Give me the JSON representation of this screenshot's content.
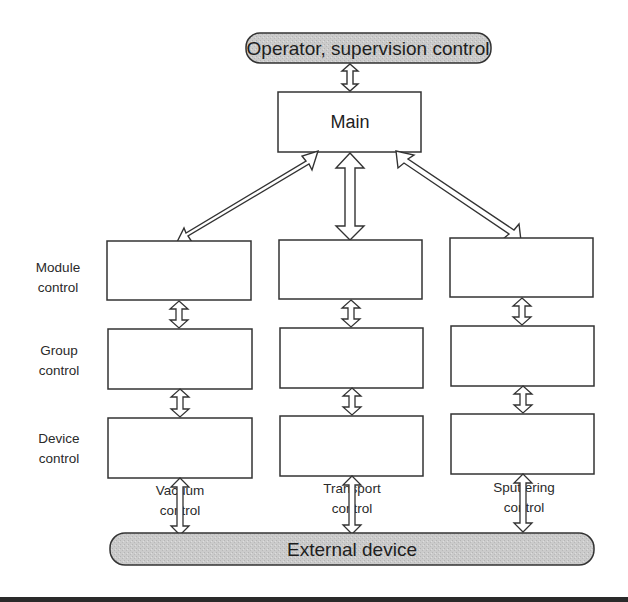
{
  "diagram": {
    "top_bus": {
      "label": "Operator, supervision control"
    },
    "main_box": {
      "label": "Main"
    },
    "bottom_bus": {
      "label": "External device"
    },
    "row_labels": [
      {
        "line1": "Module",
        "line2": "control"
      },
      {
        "line1": "Group",
        "line2": "control"
      },
      {
        "line1": "Device",
        "line2": "control"
      }
    ],
    "columns": [
      {
        "line1": "Vacuum",
        "line2": "control"
      },
      {
        "line1": "Transport",
        "line2": "control"
      },
      {
        "line1": "Sputtering",
        "line2": "control"
      }
    ],
    "colors": {
      "bus_fill": "#c8c8c8",
      "stroke": "#333333",
      "box_fill": "#ffffff",
      "bottom_bar": "#2a2a2a"
    }
  }
}
